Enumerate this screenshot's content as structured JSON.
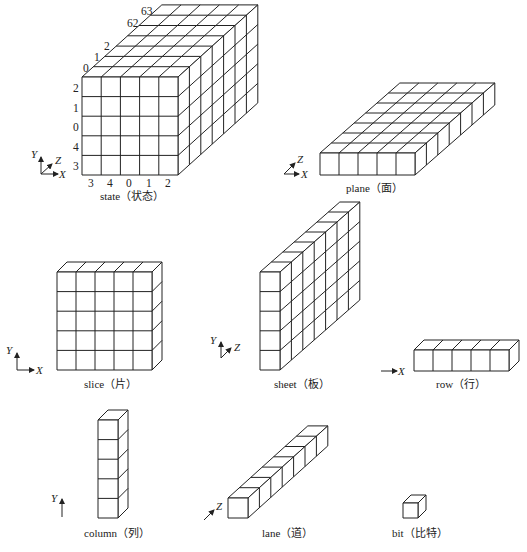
{
  "diagram": {
    "labels": {
      "state": "state（状态）",
      "plane": "plane（面）",
      "slice": "slice（片）",
      "sheet": "sheet（板）",
      "row": "row（行）",
      "column": "column（列）",
      "lane": "lane（道）",
      "bit": "bit（比特）"
    },
    "axes": {
      "x": "X",
      "y": "Y",
      "z": "Z"
    },
    "state_indices": {
      "x_ticks": [
        "3",
        "4",
        "0",
        "1",
        "2"
      ],
      "y_ticks": [
        "2",
        "1",
        "0",
        "4",
        "3"
      ],
      "z_ticks": [
        "0",
        "1",
        "2",
        "62",
        "63"
      ]
    },
    "dimensions": {
      "x_size": 5,
      "y_size": 5,
      "z_size": 64
    }
  }
}
